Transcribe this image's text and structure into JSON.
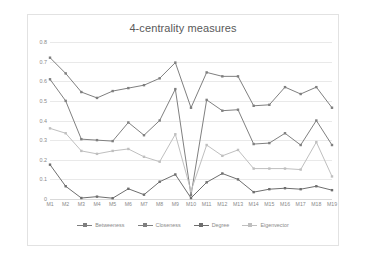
{
  "chart_data": {
    "type": "line",
    "title": "4-centrality measures",
    "xlabel": "",
    "ylabel": "",
    "ylim": [
      0,
      0.8
    ],
    "yticks": [
      0,
      0.1,
      0.2,
      0.3,
      0.4,
      0.5,
      0.6,
      0.7,
      0.8
    ],
    "ytick_labels": [
      "0",
      "0.1",
      "0.2",
      "0.3",
      "0.4",
      "0.5",
      "0.6",
      "0.7",
      "0.8"
    ],
    "grid": true,
    "legend_position": "bottom",
    "categories": [
      "M1",
      "M2",
      "M3",
      "M4",
      "M5",
      "M6",
      "M7",
      "M8",
      "M9",
      "M10",
      "M11",
      "M12",
      "M13",
      "M14",
      "M15",
      "M16",
      "M17",
      "M18",
      "M19"
    ],
    "series": [
      {
        "name": "Betweeness",
        "color": "#7f7f7f",
        "values": [
          0.72,
          0.64,
          0.545,
          0.515,
          0.55,
          0.565,
          0.58,
          0.615,
          0.695,
          0.465,
          0.645,
          0.625,
          0.625,
          0.475,
          0.48,
          0.57,
          0.535,
          0.57,
          0.465
        ]
      },
      {
        "name": "Closeness",
        "color": "#808080",
        "values": [
          0.61,
          0.5,
          0.305,
          0.3,
          0.295,
          0.39,
          0.325,
          0.4,
          0.56,
          0.02,
          0.505,
          0.45,
          0.455,
          0.28,
          0.285,
          0.335,
          0.275,
          0.4,
          0.275
        ]
      },
      {
        "name": "Degree",
        "color": "#6e6e6e",
        "values": [
          0.175,
          0.065,
          0.005,
          0.012,
          0.004,
          0.052,
          0.022,
          0.088,
          0.125,
          0.005,
          0.085,
          0.13,
          0.1,
          0.035,
          0.05,
          0.055,
          0.05,
          0.065,
          0.045
        ]
      },
      {
        "name": "Eigenvector",
        "color": "#bfbfbf",
        "values": [
          0.36,
          0.335,
          0.245,
          0.23,
          0.245,
          0.255,
          0.215,
          0.19,
          0.33,
          0.04,
          0.275,
          0.22,
          0.25,
          0.155,
          0.155,
          0.155,
          0.15,
          0.29,
          0.115
        ]
      }
    ]
  }
}
